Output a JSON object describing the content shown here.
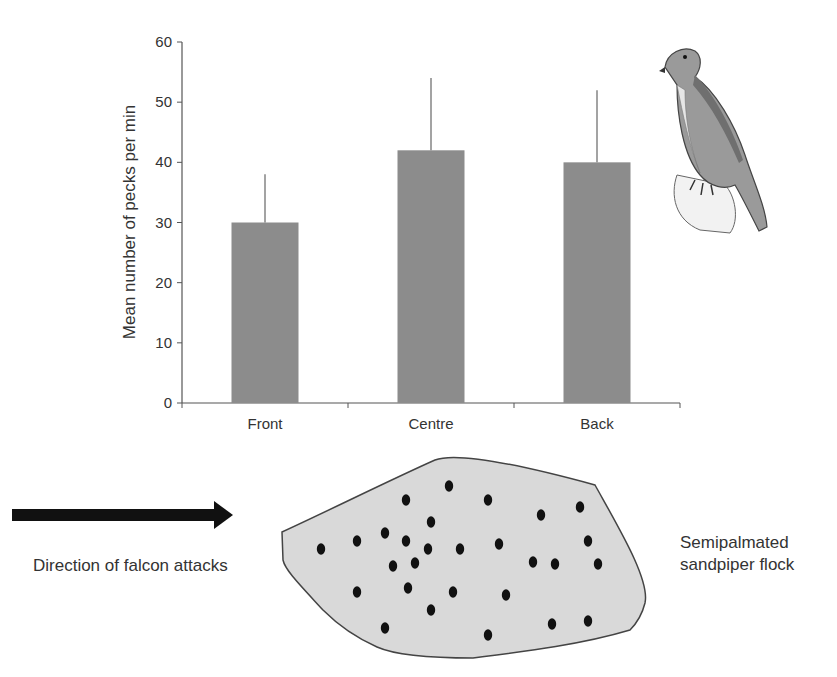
{
  "chart_data": {
    "type": "bar",
    "title": "",
    "xlabel": "",
    "ylabel": "Mean number of pecks per min",
    "categories": [
      "Front",
      "Centre",
      "Back"
    ],
    "values": [
      30,
      42,
      40
    ],
    "error_upper": [
      38,
      54,
      52
    ],
    "error_plus": [
      8,
      12,
      12
    ],
    "ylim": [
      0,
      60
    ],
    "yticks": [
      0,
      10,
      20,
      30,
      40,
      50,
      60
    ],
    "grid": false,
    "legend": null,
    "bar_color": "#8c8c8c",
    "axis_color": "#555555"
  },
  "illustration": {
    "falcon": "falcon-illustration"
  },
  "diagram": {
    "arrow_label": "Direction of falcon attacks",
    "flock_label_line1": "Semipalmated",
    "flock_label_line2": "sandpiper flock",
    "flock_fill": "#d9d9d9",
    "dot_color": "#111111",
    "dots": [
      [
        321,
        549
      ],
      [
        357,
        541
      ],
      [
        357,
        592
      ],
      [
        385,
        533
      ],
      [
        385,
        628
      ],
      [
        393,
        566
      ],
      [
        406,
        500
      ],
      [
        406,
        541
      ],
      [
        408,
        588
      ],
      [
        415,
        563
      ],
      [
        428,
        549
      ],
      [
        431,
        522
      ],
      [
        431,
        610
      ],
      [
        449,
        486
      ],
      [
        453,
        592
      ],
      [
        460,
        549
      ],
      [
        488,
        500
      ],
      [
        488,
        635
      ],
      [
        499,
        544
      ],
      [
        506,
        595
      ],
      [
        533,
        562
      ],
      [
        541,
        515
      ],
      [
        555,
        564
      ],
      [
        552,
        624
      ],
      [
        580,
        507
      ],
      [
        588,
        541
      ],
      [
        588,
        621
      ],
      [
        598,
        564
      ]
    ]
  }
}
